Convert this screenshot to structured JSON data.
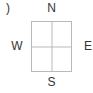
{
  "figure": {
    "panel_label": ")",
    "background_color": "#ffffff",
    "line_color": "#b9b9b9",
    "text_color": "#333333"
  },
  "compass": {
    "north": "N",
    "south": "S",
    "west": "W",
    "east": "E"
  },
  "grid": {
    "rows": 2,
    "columns": 2
  }
}
